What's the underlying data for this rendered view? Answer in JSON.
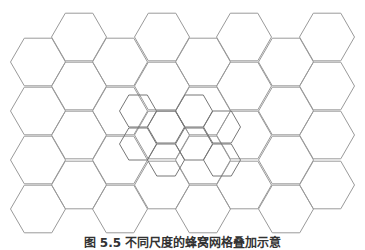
{
  "figure": {
    "type": "hexagonal-grid-diagram",
    "caption": "图 5.5  不同尺度的蜂窝网格叠加示意",
    "colors": {
      "background": "#ffffff",
      "big_hex_stroke": "#9a9a9a",
      "big_hex_stroke_emphasis": "#555555",
      "small_hex_stroke": "#777777"
    },
    "big_grid": {
      "orientation": "flat-top",
      "side": 27.5,
      "columns": [
        {
          "x": 38,
          "ys": [
            62,
            111,
            160,
            209
          ]
        },
        {
          "x": 79,
          "ys": [
            37,
            86,
            135,
            185
          ]
        },
        {
          "x": 120,
          "ys": [
            62,
            111,
            160,
            209
          ]
        },
        {
          "x": 162,
          "ys": [
            37,
            86,
            135,
            185
          ]
        },
        {
          "x": 203,
          "ys": [
            62,
            111,
            160,
            209
          ]
        },
        {
          "x": 244,
          "ys": [
            37,
            86,
            135,
            185
          ]
        },
        {
          "x": 286,
          "ys": [
            62,
            111,
            160,
            209
          ]
        },
        {
          "x": 327,
          "ys": [
            37,
            86,
            135,
            185
          ]
        }
      ]
    },
    "small_grid": {
      "orientation": "flat-top",
      "side": 18.5,
      "columns": [
        {
          "x": 138,
          "ys": [
            111,
            144
          ]
        },
        {
          "x": 166,
          "ys": [
            127,
            160
          ]
        },
        {
          "x": 194,
          "ys": [
            111,
            144
          ]
        },
        {
          "x": 222,
          "ys": [
            127,
            160
          ]
        }
      ]
    }
  }
}
